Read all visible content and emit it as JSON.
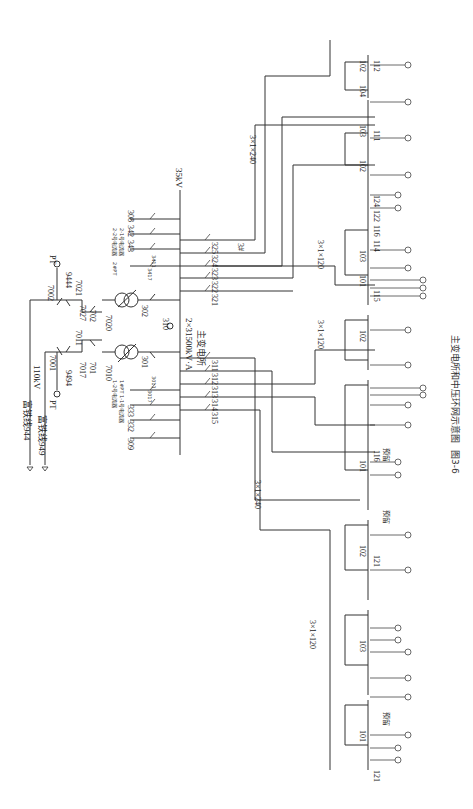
{
  "figure": {
    "caption_number": "图3-6",
    "caption_title": "主变电所和中压环网示意图"
  },
  "hv_side": {
    "voltage_label": "110kV",
    "incoming_lines": [
      {
        "label": "富铁线944"
      },
      {
        "label": "富铁线949"
      }
    ],
    "pt_labels": [
      "PT",
      "PT"
    ],
    "switch_labels": [
      "7001",
      "9494",
      "7002",
      "9444",
      "7011",
      "7017",
      "701",
      "7021",
      "7027",
      "702",
      "7010",
      "7020"
    ]
  },
  "substation": {
    "name": "主变电所",
    "capacity": "2×31500kV·A",
    "bus_voltage": "35kV",
    "bus_tie": "310",
    "transformer_breakers": [
      "301",
      "302"
    ],
    "section1_feeders": [
      "309",
      "332",
      "333",
      "311",
      "312",
      "313",
      "314",
      "315"
    ],
    "section2_feeders": [
      "308",
      "342",
      "343",
      "321",
      "322",
      "323",
      "324",
      "325"
    ],
    "aux_labels": {
      "pt1": "1#PT",
      "arrester1a": "1-1号电流器",
      "arrester1b": "1-2号电流器",
      "pt2": "2#PT",
      "arrester2a": "2-1号电流器",
      "arrester2b": "2-2号电流器",
      "s3011": "3011",
      "s3017": "3017",
      "s3411": "3411",
      "s3417": "3417",
      "s3_label": "3#"
    }
  },
  "cables": [
    {
      "label": "3×1×240"
    },
    {
      "label": "3×1×240"
    },
    {
      "label": "3×1×120"
    },
    {
      "label": "3×1×120"
    },
    {
      "label": "3×1×120"
    },
    {
      "label": "3×1×120"
    }
  ],
  "ring_units": {
    "bus_labels": [
      "101",
      "102",
      "103",
      "104",
      "100"
    ],
    "feeder_labels": [
      "111",
      "112",
      "113",
      "114",
      "115",
      "116",
      "121",
      "122",
      "123",
      "124"
    ],
    "reserved_label": "预留"
  }
}
